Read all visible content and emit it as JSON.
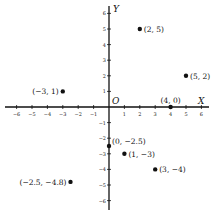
{
  "diagram": {
    "type": "cartesian-plane",
    "axes": {
      "x_label": "X",
      "y_label": "Y",
      "origin_label": "O",
      "x_range": [
        -6,
        6
      ],
      "y_range": [
        -6,
        6
      ]
    },
    "x_ticks": [
      "-6",
      "-5",
      "-4",
      "-3",
      "-2",
      "-1",
      "1",
      "2",
      "3",
      "4",
      "5",
      "6"
    ],
    "y_ticks": [
      "6",
      "5",
      "4",
      "3",
      "2",
      "1",
      "-1",
      "-2",
      "-3",
      "-4",
      "-5",
      "-6"
    ],
    "points": [
      {
        "x": 2,
        "y": 5,
        "label": "(2, 5)"
      },
      {
        "x": 5,
        "y": 2,
        "label": "(5, 2)"
      },
      {
        "x": -3,
        "y": 1,
        "label": "(−3, 1)"
      },
      {
        "x": 4,
        "y": 0,
        "label": "(4, 0)"
      },
      {
        "x": 0,
        "y": -2.5,
        "label": "(0, −2.5)"
      },
      {
        "x": 1,
        "y": -3,
        "label": "(1, −3)"
      },
      {
        "x": 3,
        "y": -4,
        "label": "(3, −4)"
      },
      {
        "x": -2.5,
        "y": -4.8,
        "label": "(−2.5, −4.8)"
      }
    ]
  }
}
